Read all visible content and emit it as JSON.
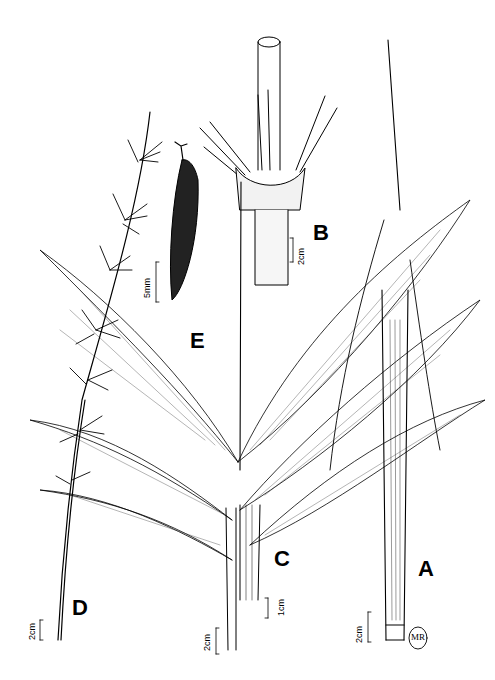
{
  "figure": {
    "type": "botanical-illustration",
    "ink_color": "#000000",
    "background": "#ffffff"
  },
  "panels": {
    "A": {
      "label": "A",
      "scale": "2cm"
    },
    "B": {
      "label": "B",
      "scale": "2cm"
    },
    "C": {
      "label": "C",
      "scale_left": "2cm",
      "scale_right": "1cm"
    },
    "D": {
      "label": "D",
      "scale": "2cm"
    },
    "E": {
      "label": "E",
      "scale": "5mm"
    }
  },
  "signature": {
    "initials": "MR"
  }
}
